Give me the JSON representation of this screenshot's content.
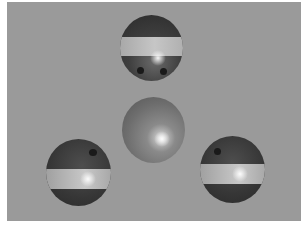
{
  "scene": {
    "description": "Grayscale 3D render of four spheres arranged in a triangle pattern on a flat gray background",
    "background_color": "#9a9a9a",
    "border_color": "#ffffff",
    "spheres": [
      {
        "id": "top",
        "type": "banded",
        "holes": 2
      },
      {
        "id": "center",
        "type": "plain",
        "holes": 0
      },
      {
        "id": "bottom-left",
        "type": "banded",
        "holes": 1
      },
      {
        "id": "bottom-right",
        "type": "banded",
        "holes": 1
      }
    ]
  }
}
